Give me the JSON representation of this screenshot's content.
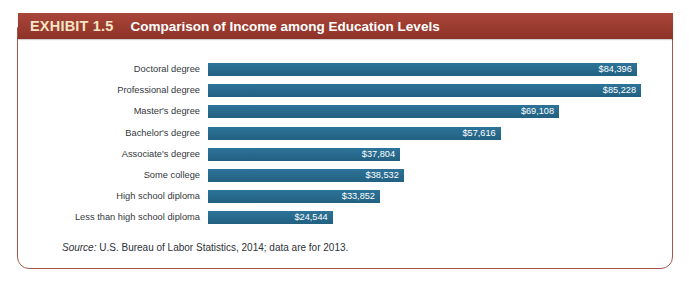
{
  "header": {
    "exhibit_tag": "EXHIBIT 1.5",
    "title": "Comparison of Income among Education Levels",
    "band_color": "#9a3b30",
    "tag_color": "#f4e6c2",
    "title_color": "#ffffff"
  },
  "panel": {
    "border_color": "#a9564a",
    "background": "#ffffff"
  },
  "source": {
    "label": "Source:",
    "text": " U.S. Bureau of Labor Statistics, 2014; data are for 2013."
  },
  "chart_data": {
    "type": "bar",
    "orientation": "horizontal",
    "title": "Comparison of Income among Education Levels",
    "xlabel": "",
    "ylabel": "",
    "grid": false,
    "legend": null,
    "xlim": [
      0,
      85228
    ],
    "bar_color": "#276a8e",
    "value_label_color": "#ffffff",
    "value_label_position": "inside-end",
    "categories": [
      "Doctoral degree",
      "Professional degree",
      "Master's degree",
      "Bachelor's degree",
      "Associate's degree",
      "Some college",
      "High school diploma",
      "Less than high school diploma"
    ],
    "values": [
      84396,
      85228,
      69108,
      57616,
      37804,
      38532,
      33852,
      24544
    ],
    "value_labels": [
      "$84,396",
      "$85,228",
      "$69,108",
      "$57,616",
      "$37,804",
      "$38,532",
      "$33,852",
      "$24,544"
    ]
  }
}
